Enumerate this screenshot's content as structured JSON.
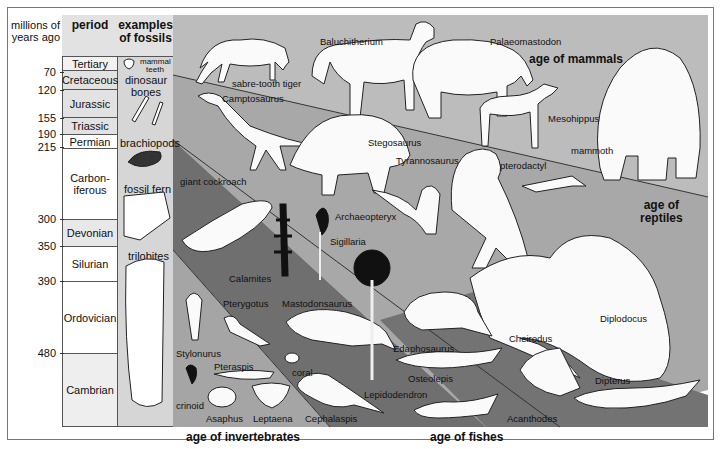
{
  "table": {
    "headers": {
      "years": "millions of years ago",
      "period": "period",
      "fossils": "examples of fossils"
    },
    "years_marks": [
      {
        "value": "70",
        "y": 72
      },
      {
        "value": "120",
        "y": 90
      },
      {
        "value": "155",
        "y": 118
      },
      {
        "value": "190",
        "y": 134
      },
      {
        "value": "215",
        "y": 147
      },
      {
        "value": "300",
        "y": 219
      },
      {
        "value": "350",
        "y": 246
      },
      {
        "value": "390",
        "y": 281
      },
      {
        "value": "480",
        "y": 353
      }
    ],
    "periods": [
      {
        "name": "Tertiary",
        "top": 57,
        "height": 14,
        "shade": "#f2f2f2"
      },
      {
        "name": "Cretaceous",
        "top": 71,
        "height": 19,
        "shade": "#e2e2e2"
      },
      {
        "name": "Jurassic",
        "top": 90,
        "height": 28,
        "shade": "#e2e2e2"
      },
      {
        "name": "Triassic",
        "top": 118,
        "height": 17,
        "shade": "#e2e2e2"
      },
      {
        "name": "Permian",
        "top": 135,
        "height": 14,
        "shade": "#ffffff"
      },
      {
        "name": "Carbon-\niferous",
        "top": 149,
        "height": 71,
        "shade": "#ffffff"
      },
      {
        "name": "Devonian",
        "top": 220,
        "height": 27,
        "shade": "#e8e8e8"
      },
      {
        "name": "Silurian",
        "top": 247,
        "height": 35,
        "shade": "#ffffff"
      },
      {
        "name": "Ordovician",
        "top": 282,
        "height": 72,
        "shade": "#ffffff"
      },
      {
        "name": "Cambrian",
        "top": 354,
        "height": 73,
        "shade": "#eeeeee"
      }
    ],
    "fossils": [
      {
        "name": "mammal teeth",
        "x": 140,
        "y": 58,
        "icon": "tooth-icon"
      },
      {
        "name": "dinosaur bones",
        "x": 122,
        "y": 74,
        "icon": "bone-icon"
      },
      {
        "name": "brachiopods",
        "x": 120,
        "y": 137,
        "icon": "brachiopod-icon"
      },
      {
        "name": "fossil fern",
        "x": 124,
        "y": 183,
        "icon": "fern-fossil-icon"
      },
      {
        "name": "trilobites",
        "x": 128,
        "y": 250,
        "icon": "trilobite-icon"
      }
    ]
  },
  "bands": {
    "mammals": {
      "label": "age of mammals",
      "color": "#bcbcbc"
    },
    "reptiles": {
      "label": "age of\nreptiles",
      "color": "#a8a8a8"
    },
    "amphibians": {
      "color": "#6f6f6f"
    },
    "invertebrates": {
      "label": "age of invertebrates",
      "color": "#a5a5a5"
    },
    "fishes": {
      "label": "age of fishes",
      "color": "#727272"
    }
  },
  "animals": {
    "mammals": [
      {
        "name": "sabre-tooth tiger",
        "x": 232,
        "y": 78
      },
      {
        "name": "Baluchitherium",
        "x": 320,
        "y": 36
      },
      {
        "name": "Palaeomastodon",
        "x": 490,
        "y": 36
      },
      {
        "name": "Mesohippus",
        "x": 548,
        "y": 113
      },
      {
        "name": "mammoth",
        "x": 571,
        "y": 145
      }
    ],
    "reptiles": [
      {
        "name": "Camptosaurus",
        "x": 222,
        "y": 93
      },
      {
        "name": "Stegosaurus",
        "x": 368,
        "y": 137
      },
      {
        "name": "Tyrannosaurus",
        "x": 396,
        "y": 155
      },
      {
        "name": "pterodactyl",
        "x": 500,
        "y": 160
      },
      {
        "name": "Archaeopteryx",
        "x": 335,
        "y": 211
      },
      {
        "name": "Diplodocus",
        "x": 600,
        "y": 313
      }
    ],
    "amphibians": [
      {
        "name": "giant cockroach",
        "x": 180,
        "y": 176
      },
      {
        "name": "Sigillaria",
        "x": 330,
        "y": 236
      },
      {
        "name": "Calamites",
        "x": 229,
        "y": 273
      },
      {
        "name": "Pterygotus",
        "x": 223,
        "y": 298
      },
      {
        "name": "Mastodonsaurus",
        "x": 282,
        "y": 298
      },
      {
        "name": "Lepidodendron",
        "x": 364,
        "y": 389
      }
    ],
    "fishes": [
      {
        "name": "Edaphosaurus",
        "x": 393,
        "y": 343
      },
      {
        "name": "Cheirodus",
        "x": 509,
        "y": 333
      },
      {
        "name": "Osteolepis",
        "x": 408,
        "y": 373
      },
      {
        "name": "Dipterus",
        "x": 595,
        "y": 375
      },
      {
        "name": "Acanthodes",
        "x": 507,
        "y": 413
      }
    ],
    "invertebrates": [
      {
        "name": "Stylonurus",
        "x": 176,
        "y": 348
      },
      {
        "name": "Pteraspis",
        "x": 214,
        "y": 361
      },
      {
        "name": "coral",
        "x": 292,
        "y": 367
      },
      {
        "name": "crinoid",
        "x": 176,
        "y": 400
      },
      {
        "name": "Asaphus",
        "x": 206,
        "y": 413
      },
      {
        "name": "Leptaena",
        "x": 253,
        "y": 413
      },
      {
        "name": "Cephalaspis",
        "x": 305,
        "y": 413
      }
    ]
  }
}
